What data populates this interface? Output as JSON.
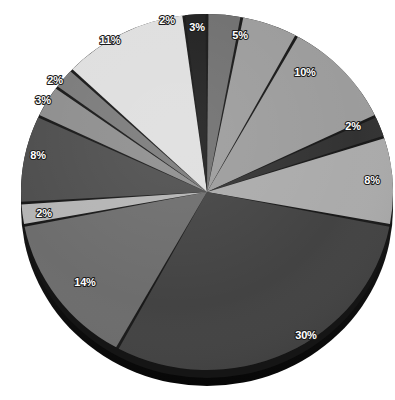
{
  "figure": {
    "title": "",
    "background": "#ffffff",
    "width": 395,
    "height": 400
  },
  "chart_data": {
    "type": "pie",
    "title": "",
    "subtitle": "",
    "xlabel": "",
    "ylabel": "",
    "legend": "none",
    "grid": false,
    "style": "3d-grayscale-exploded-edges",
    "label_format": "percent",
    "total": 100,
    "categories": [
      "Slice 1",
      "Slice 2",
      "Slice 3",
      "Slice 4",
      "Slice 5",
      "Slice 6",
      "Slice 7",
      "Slice 8",
      "Slice 9",
      "Slice 10",
      "Slice 11",
      "Slice 12",
      "Slice 13"
    ],
    "values": [
      3,
      5,
      10,
      2,
      8,
      30,
      14,
      2,
      8,
      3,
      2,
      11,
      2
    ],
    "labels": [
      "3%",
      "5%",
      "10%",
      "2%",
      "8%",
      "30%",
      "14%",
      "2%",
      "8%",
      "3%",
      "2%",
      "11%",
      "2%"
    ],
    "colors": [
      "#6d6d6d",
      "#9a9a9a",
      "#9a9a9a",
      "#2e2e2e",
      "#a9a9a9",
      "#3f3f3f",
      "#6a6a6a",
      "#b3b3b3",
      "#4b4b4b",
      "#8c8c8c",
      "#787878",
      "#dedede",
      "#1c1c1c"
    ],
    "slices": [
      {
        "label": "3%",
        "value": 3,
        "color": "#6d6d6d",
        "label_x": 197,
        "label_y": 28
      },
      {
        "label": "5%",
        "value": 5,
        "color": "#9a9a9a",
        "label_x": 240,
        "label_y": 36
      },
      {
        "label": "10%",
        "value": 10,
        "color": "#9a9a9a",
        "label_x": 305,
        "label_y": 73
      },
      {
        "label": "2%",
        "value": 2,
        "color": "#2e2e2e",
        "label_x": 353,
        "label_y": 127
      },
      {
        "label": "8%",
        "value": 8,
        "color": "#a9a9a9",
        "label_x": 372,
        "label_y": 181
      },
      {
        "label": "30%",
        "value": 30,
        "color": "#3f3f3f",
        "label_x": 306,
        "label_y": 336
      },
      {
        "label": "14%",
        "value": 14,
        "color": "#6a6a6a",
        "label_x": 85,
        "label_y": 283
      },
      {
        "label": "2%",
        "value": 2,
        "color": "#b3b3b3",
        "label_x": 44,
        "label_y": 214
      },
      {
        "label": "8%",
        "value": 8,
        "color": "#4b4b4b",
        "label_x": 38,
        "label_y": 156
      },
      {
        "label": "3%",
        "value": 3,
        "color": "#8c8c8c",
        "label_x": 43,
        "label_y": 101
      },
      {
        "label": "2%",
        "value": 2,
        "color": "#787878",
        "label_x": 55,
        "label_y": 81
      },
      {
        "label": "11%",
        "value": 11,
        "color": "#dedede",
        "label_x": 110,
        "label_y": 41
      },
      {
        "label": "2%",
        "value": 2,
        "color": "#1c1c1c",
        "label_x": 167,
        "label_y": 21
      }
    ]
  },
  "geometry": {
    "center_x": 207,
    "center_y": 192,
    "radius_x": 186,
    "radius_y": 178,
    "depth": 16,
    "start_angle_deg": -90,
    "direction": "clockwise",
    "side_wall_color": "#151515",
    "divider_color": "#141414"
  }
}
